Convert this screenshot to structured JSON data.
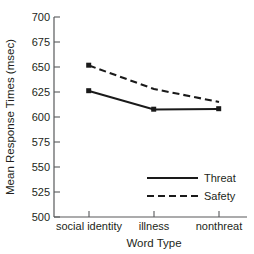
{
  "chart_data": {
    "type": "line",
    "title": "",
    "subtitle": "",
    "xlabel": "Word Type",
    "ylabel": "Mean Response Times (msec)",
    "categories": [
      "social identity",
      "illness",
      "nonthreat"
    ],
    "ylim": [
      500,
      700
    ],
    "yticks": [
      500,
      525,
      550,
      575,
      600,
      625,
      650,
      675,
      700
    ],
    "ytick_labels": [
      "500",
      "525",
      "550",
      "575",
      "600",
      "625",
      "650",
      "675",
      "700"
    ],
    "grid": false,
    "legend_position": "lower-right",
    "series": [
      {
        "name": "Threat",
        "style": "solid",
        "marker": "square",
        "color": "#1a1a1a",
        "values": [
          626,
          607.5,
          608
        ]
      },
      {
        "name": "Safety",
        "style": "dashed",
        "marker": "none",
        "color": "#1a1a1a",
        "values": [
          651.5,
          628,
          615
        ]
      }
    ],
    "annotations": []
  },
  "legend": {
    "entries": [
      {
        "label": "Threat",
        "style": "solid"
      },
      {
        "label": "Safety",
        "style": "dashed"
      }
    ]
  },
  "icons": {
    "solid_line": "solid-line-swatch-icon",
    "dashed_line": "dashed-line-swatch-icon"
  }
}
